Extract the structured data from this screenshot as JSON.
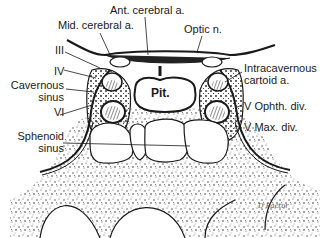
{
  "diagram": {
    "labels": {
      "ant_cerebral": "Ant. cerebral a.",
      "mid_cerebral": "Mid. cerebral a.",
      "optic": "Optic n.",
      "cn3": "III",
      "cn4": "IV",
      "cavernous_1": "Cavernous",
      "cavernous_2": "sinus",
      "cn6": "VI",
      "intracav_1": "Intracavernous",
      "intracav_2": "cartoid a.",
      "v_ophth": "V Ophth. div.",
      "v_max": "V Max. div.",
      "sphenoid_1": "Sphenoid",
      "sphenoid_2": "sinus",
      "pit": "Pit.",
      "signature": "D Factor"
    },
    "colors": {
      "ink": "#1a1a1a",
      "background": "#ffffff",
      "bone_speckle": "#333333"
    }
  }
}
